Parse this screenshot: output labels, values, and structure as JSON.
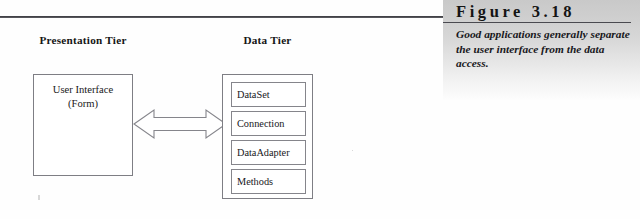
{
  "figure": {
    "title": "Figure 3.18",
    "caption": "Good applications generally separate the user interface from the data access."
  },
  "diagram": {
    "presentation_tier": {
      "heading": "Presentation Tier",
      "box_label_line1": "User Interface",
      "box_label_line2": "(Form)"
    },
    "connector": {
      "name": "double-headed-arrow",
      "direction": "bidirectional"
    },
    "data_tier": {
      "heading": "Data Tier",
      "items": [
        {
          "label": "DataSet"
        },
        {
          "label": "Connection"
        },
        {
          "label": "DataAdapter"
        },
        {
          "label": "Methods"
        }
      ]
    }
  },
  "colors": {
    "page_background": "#ffffff",
    "rule": "#2e2e33",
    "box_border": "#7e7e84",
    "caption_panel_top": "#c9c9c9",
    "caption_panel_bottom": "#fdfdfd",
    "text": "#18181c"
  }
}
